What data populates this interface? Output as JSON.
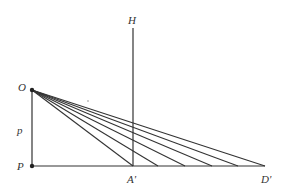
{
  "diagram": {
    "colors": {
      "line": "#333333",
      "background": "#ffffff"
    },
    "points": {
      "O": {
        "label": "O",
        "x": 32,
        "y": 90
      },
      "P": {
        "label": "P",
        "x": 32,
        "y": 166
      },
      "A_prime": {
        "label": "A'",
        "x": 133,
        "y": 166
      },
      "D_prime": {
        "label": "D'",
        "x": 265,
        "y": 166
      },
      "H": {
        "label": "H",
        "x": 133,
        "y": 28
      }
    },
    "segment_label": {
      "label": "p"
    },
    "ray_endpoints_x": [
      133,
      158,
      185,
      212,
      238,
      265
    ],
    "labels": {
      "O": "O",
      "H": "H",
      "p": "p",
      "P": "P",
      "A_prime": "A'",
      "D_prime": "D'"
    }
  }
}
